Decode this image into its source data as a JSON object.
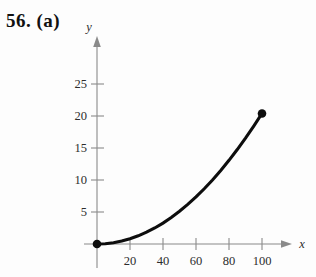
{
  "problem": {
    "label": "56. (a)"
  },
  "chart_data": {
    "type": "line",
    "title": "",
    "subtitle": "",
    "xlabel": "x",
    "ylabel": "y",
    "xlim": [
      0,
      115
    ],
    "ylim": [
      0,
      28
    ],
    "grid": false,
    "legend": null,
    "x_ticks": [
      20,
      40,
      60,
      80,
      100
    ],
    "x_tick_labels": [
      "20",
      "40",
      "60",
      "80",
      "100"
    ],
    "y_ticks": [
      5,
      10,
      15,
      20,
      25
    ],
    "y_tick_labels": [
      "5",
      "10",
      "15",
      "20",
      "25"
    ],
    "series": [
      {
        "name": "curve",
        "x": [
          0,
          5,
          10,
          15,
          20,
          25,
          30,
          35,
          40,
          45,
          50,
          55,
          60,
          65,
          70,
          75,
          80,
          85,
          90,
          95,
          100
        ],
        "y": [
          0,
          0.05,
          0.2,
          0.46,
          0.82,
          1.28,
          1.84,
          2.5,
          3.27,
          4.14,
          5.11,
          6.18,
          7.36,
          8.63,
          10.01,
          11.49,
          13.07,
          14.76,
          16.54,
          18.43,
          20.4
        ]
      }
    ],
    "endpoints": [
      {
        "name": "origin-point",
        "x": 0,
        "y": 0,
        "label": ""
      },
      {
        "name": "terminal-point",
        "x": 100,
        "y": 20.4,
        "label": ""
      }
    ],
    "colors": {
      "curve": "#0d0d0d",
      "axis": "#8a8a8a",
      "point": "#0d0d0d",
      "text": "#2c2c2c",
      "background": "#fdfdfd"
    }
  }
}
